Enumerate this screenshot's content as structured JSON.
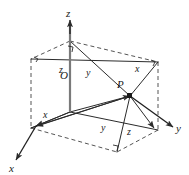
{
  "figure": {
    "background_color": "#ffffff",
    "line_color": "#2b2b2b",
    "dashed_color": "#555555",
    "label_color": "#1a1a1a",
    "axes": [
      {
        "name": "x-axis",
        "label": "x",
        "direction": "lower-left"
      },
      {
        "name": "y-axis",
        "label": "y",
        "direction": "right"
      },
      {
        "name": "z-axis",
        "label": "z",
        "direction": "up"
      }
    ],
    "points": [
      {
        "name": "origin",
        "label": "O"
      },
      {
        "name": "point-p",
        "label": "P"
      }
    ],
    "edge_labels": [
      {
        "name": "edge-label-z-upper-left",
        "label": "z"
      },
      {
        "name": "edge-label-y-upper-middle",
        "label": "y"
      },
      {
        "name": "edge-label-x-upper-right",
        "label": "x"
      },
      {
        "name": "edge-label-x-lower-left",
        "label": "x"
      },
      {
        "name": "edge-label-y-lower-middle",
        "label": "y"
      },
      {
        "name": "edge-label-z-lower-right",
        "label": "z"
      }
    ],
    "right_angle_markers": 4
  }
}
